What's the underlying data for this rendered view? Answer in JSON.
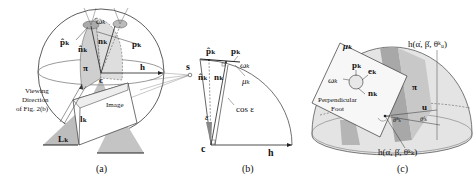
{
  "figure": {
    "panels": [
      {
        "id": "a",
        "caption": "(a)",
        "labels": {
          "p_hat": "p̂ₖ",
          "n_hat": "n̂ₖ",
          "omega": "ωₖ",
          "n": "nₖ",
          "p": "pₖ",
          "pi": "π",
          "c": "c",
          "h": "h",
          "s": "s",
          "viewing_line1": "Viewing",
          "viewing_line2": "Direction",
          "viewing_line3": "of Fig. 2(b)",
          "image": "Image",
          "l": "lₖ",
          "L": "Lₖ"
        }
      },
      {
        "id": "b",
        "caption": "(b)",
        "labels": {
          "p_hat": "p̂ₖ",
          "p": "pₖ",
          "omega": "ωₖ",
          "n_hat": "n̂ₖ",
          "n": "nₖ",
          "mu": "μₖ",
          "cos_eps": "cos ε",
          "eps": "ε",
          "c": "c",
          "h": "h"
        }
      },
      {
        "id": "c",
        "caption": "(c)",
        "labels": {
          "mu": "μₖ",
          "p": "pₖ",
          "omega": "ωₖ",
          "e": "eₖ",
          "n": "nₖ",
          "perp1": "Perpendicular",
          "perp2": "Foot",
          "h_top": "h(α̇, β̇, θᵏᵤ)",
          "pi": "π",
          "u": "u",
          "theta_k": "θᵏₖ",
          "theta_l": "θˡₖ",
          "h_bottom": "h(α̇, β̇, θᵏₖ)"
        }
      }
    ]
  }
}
